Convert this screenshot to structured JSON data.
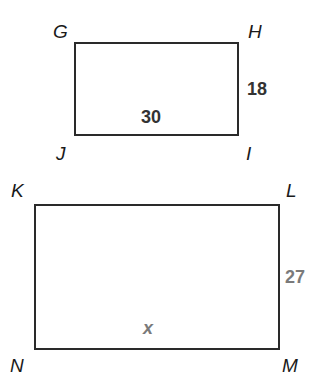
{
  "figures": [
    {
      "name": "rectangle-GHIJ",
      "vertices": {
        "top_left": "G",
        "top_right": "H",
        "bottom_right": "I",
        "bottom_left": "J"
      },
      "measures": {
        "bottom": "30",
        "right": "18"
      },
      "measure_color": "#333333"
    },
    {
      "name": "rectangle-KLMN",
      "vertices": {
        "top_left": "K",
        "top_right": "L",
        "bottom_right": "M",
        "bottom_left": "N"
      },
      "measures": {
        "bottom": "x",
        "right": "27"
      },
      "measure_color": "#7a7a7a"
    }
  ],
  "colors": {
    "stroke": "#2a2a2a",
    "label": "#1a1a1a",
    "background": "#ffffff"
  }
}
